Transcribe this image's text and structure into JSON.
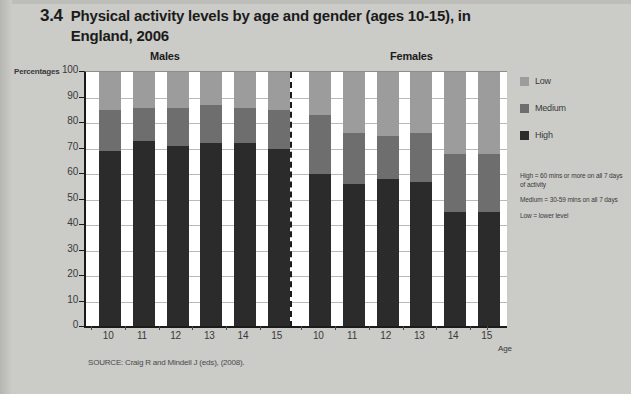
{
  "figure": {
    "number": "3.4",
    "title": "Physical activity levels by age and gender (ages 10-15), in England, 2006",
    "source": "SOURCE: Craig R and Mindell J (eds), (2008)."
  },
  "groups": {
    "males_label": "Males",
    "females_label": "Females"
  },
  "axis": {
    "y_title": "Percentages",
    "x_title": "Age"
  },
  "legend": {
    "items": [
      {
        "label": "Low",
        "color": "#9c9c9c"
      },
      {
        "label": "Medium",
        "color": "#6e6e6e"
      },
      {
        "label": "High",
        "color": "#2b2b2b"
      }
    ]
  },
  "definitions": [
    "High = 60 mins or more on all 7 days of activity",
    "Medium = 30-59 mins on all 7 days",
    "Low = lower level"
  ],
  "chart_data": {
    "type": "bar",
    "stacked": true,
    "title": "Physical activity levels by age and gender (ages 10-15), in England, 2006",
    "xlabel": "Age",
    "ylabel": "Percentages",
    "ylim": [
      0,
      100
    ],
    "yticks": [
      0,
      10,
      20,
      30,
      40,
      50,
      60,
      70,
      80,
      90,
      100
    ],
    "grid": true,
    "legend_position": "right",
    "groups": [
      "Males",
      "Females"
    ],
    "categories": [
      "10",
      "11",
      "12",
      "13",
      "14",
      "15"
    ],
    "series": [
      {
        "name": "High",
        "color": "#2b2b2b",
        "Males": [
          69,
          73,
          71,
          72,
          72,
          70
        ],
        "Females": [
          60,
          56,
          58,
          57,
          45,
          45
        ]
      },
      {
        "name": "Medium",
        "color": "#6e6e6e",
        "Males": [
          16,
          13,
          15,
          15,
          14,
          15
        ],
        "Females": [
          23,
          20,
          17,
          19,
          23,
          23
        ]
      },
      {
        "name": "Low",
        "color": "#9c9c9c",
        "Males": [
          15,
          14,
          14,
          13,
          14,
          15
        ],
        "Females": [
          17,
          24,
          25,
          24,
          32,
          32
        ]
      }
    ],
    "cumulative_high_plus_medium": {
      "Males": [
        85,
        86,
        86,
        87,
        86,
        85
      ],
      "Females": [
        83,
        76,
        75,
        76,
        68,
        68
      ]
    }
  }
}
